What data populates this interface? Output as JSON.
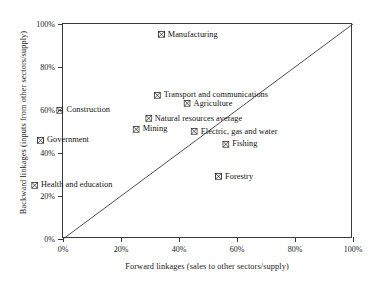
{
  "chart_data": {
    "type": "scatter",
    "title": "",
    "xlabel": "Forward linkages (sales to other sectors/supply)",
    "ylabel": "Backward linkages (inputs from other sectors/supply)",
    "xlim": [
      0,
      100
    ],
    "ylim": [
      0,
      100
    ],
    "xticks": [
      "0%",
      "20%",
      "40%",
      "60%",
      "80%",
      "100%"
    ],
    "xtick_values": [
      0,
      20,
      40,
      60,
      80,
      100
    ],
    "yticks": [
      "0%",
      "20%",
      "40%",
      "60%",
      "80%",
      "100%"
    ],
    "ytick_values": [
      0,
      20,
      40,
      60,
      80,
      100
    ],
    "grid": false,
    "legend": "none",
    "marker": "crossed-square",
    "marker_color": "#2b2b2b",
    "axis_color": "#3a3a3a",
    "reference_line": {
      "name": "45-degree diagonal",
      "from": [
        0,
        0
      ],
      "to": [
        100,
        100
      ]
    },
    "points": [
      {
        "label": "Manufacturing",
        "x": 43,
        "y": 95,
        "label_side": "right"
      },
      {
        "label": "Transport and communications",
        "x": 51,
        "y": 67,
        "label_side": "right"
      },
      {
        "label": "Agriculture",
        "x": 50,
        "y": 63,
        "label_side": "right"
      },
      {
        "label": "Natural resources average",
        "x": 45,
        "y": 56,
        "label_side": "right"
      },
      {
        "label": "Construction",
        "x": 7,
        "y": 60,
        "label_side": "right"
      },
      {
        "label": "Mining",
        "x": 30,
        "y": 51,
        "label_side": "right"
      },
      {
        "label": "Electric, gas and water",
        "x": 59,
        "y": 50,
        "label_side": "right"
      },
      {
        "label": "Fishing",
        "x": 61,
        "y": 44,
        "label_side": "right"
      },
      {
        "label": "Government",
        "x": 0,
        "y": 46,
        "label_side": "right"
      },
      {
        "label": "Forestry",
        "x": 59,
        "y": 29,
        "label_side": "right"
      },
      {
        "label": "Health and education",
        "x": 3,
        "y": 25,
        "label_side": "right"
      }
    ]
  }
}
